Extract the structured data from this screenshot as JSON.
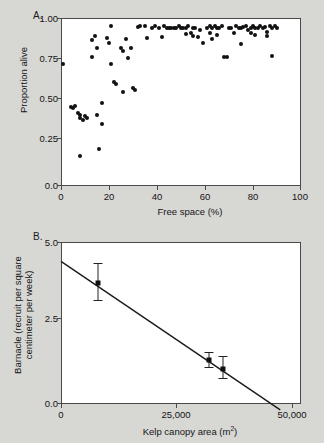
{
  "figure": {
    "background_color": "#d7d7d4",
    "plot_background": "#ffffff",
    "axis_color": "#4a4a4a",
    "marker_color": "#111111"
  },
  "panel_a": {
    "letter": "A.",
    "ylabel": "Proportion alive",
    "xlabel": "Free space (%)",
    "ytick_labels": [
      "1.00",
      "0.75",
      "0.50",
      "0.25",
      "0.0"
    ],
    "xtick_labels": [
      "0",
      "20",
      "40",
      "60",
      "80",
      "100"
    ]
  },
  "panel_b": {
    "letter": "B.",
    "ylabel_line1": "Barnacle (recruit per square",
    "ylabel_line2": "centimeter per week)",
    "xlabel_prefix": "Kelp canopy area (m",
    "xlabel_sup": "2",
    "xlabel_suffix": ")",
    "ytick_labels": [
      "5.0",
      "2.5",
      "0.0"
    ],
    "xtick_labels": [
      "0",
      "25,000",
      "50,000"
    ]
  },
  "chart_data": [
    {
      "type": "scatter",
      "panel": "A",
      "title": "",
      "xlabel": "Free space (%)",
      "ylabel": "Proportion alive",
      "xlim": [
        0,
        100
      ],
      "ylim": [
        0.0,
        1.05
      ],
      "xticks": [
        0,
        20,
        40,
        60,
        80,
        100
      ],
      "yticks": [
        0.0,
        0.25,
        0.5,
        0.75,
        1.0
      ],
      "grid": false,
      "legend": "none",
      "marker": "filled-circle",
      "points": [
        [
          1,
          0.765
        ],
        [
          4,
          0.495
        ],
        [
          5,
          0.49
        ],
        [
          6,
          0.5
        ],
        [
          7,
          0.455
        ],
        [
          8,
          0.445
        ],
        [
          8,
          0.425
        ],
        [
          8,
          0.185
        ],
        [
          9,
          0.41
        ],
        [
          10,
          0.435
        ],
        [
          11,
          0.425
        ],
        [
          13,
          0.91
        ],
        [
          13,
          0.805
        ],
        [
          14,
          0.935
        ],
        [
          15,
          0.86
        ],
        [
          15,
          0.445
        ],
        [
          16,
          0.23
        ],
        [
          17,
          0.52
        ],
        [
          17,
          0.385
        ],
        [
          19,
          0.925
        ],
        [
          20,
          0.895
        ],
        [
          21,
          1.0
        ],
        [
          21,
          0.765
        ],
        [
          22,
          0.65
        ],
        [
          23,
          0.635
        ],
        [
          25,
          0.86
        ],
        [
          26,
          0.845
        ],
        [
          26,
          0.59
        ],
        [
          27,
          0.92
        ],
        [
          28,
          0.8
        ],
        [
          29,
          0.865
        ],
        [
          30,
          0.615
        ],
        [
          31,
          0.6
        ],
        [
          32,
          0.995
        ],
        [
          33,
          1.0
        ],
        [
          35,
          1.0
        ],
        [
          36,
          0.925
        ],
        [
          38,
          0.985
        ],
        [
          39,
          1.0
        ],
        [
          41,
          0.99
        ],
        [
          42,
          0.93
        ],
        [
          43,
          1.0
        ],
        [
          44,
          0.985
        ],
        [
          45,
          0.985
        ],
        [
          46,
          0.99
        ],
        [
          47,
          0.985
        ],
        [
          48,
          0.99
        ],
        [
          49,
          1.0
        ],
        [
          50,
          0.985
        ],
        [
          51,
          0.99
        ],
        [
          52,
          0.95
        ],
        [
          52,
          0.985
        ],
        [
          53,
          1.0
        ],
        [
          54,
          0.955
        ],
        [
          55,
          0.985
        ],
        [
          55,
          0.94
        ],
        [
          56,
          0.99
        ],
        [
          57,
          0.93
        ],
        [
          58,
          0.975
        ],
        [
          59,
          0.895
        ],
        [
          61,
          0.99
        ],
        [
          62,
          1.0
        ],
        [
          62,
          0.955
        ],
        [
          63,
          0.985
        ],
        [
          63,
          0.92
        ],
        [
          64,
          1.0
        ],
        [
          65,
          0.985
        ],
        [
          65,
          0.945
        ],
        [
          66,
          0.99
        ],
        [
          67,
          1.0
        ],
        [
          68,
          0.805
        ],
        [
          69,
          0.805
        ],
        [
          70,
          0.985
        ],
        [
          71,
          0.99
        ],
        [
          72,
          0.955
        ],
        [
          73,
          1.0
        ],
        [
          74,
          0.985
        ],
        [
          75,
          0.99
        ],
        [
          75,
          0.885
        ],
        [
          76,
          0.995
        ],
        [
          77,
          1.0
        ],
        [
          78,
          0.975
        ],
        [
          79,
          0.99
        ],
        [
          79,
          0.955
        ],
        [
          80,
          1.0
        ],
        [
          81,
          0.985
        ],
        [
          81,
          0.945
        ],
        [
          82,
          0.99
        ],
        [
          83,
          1.0
        ],
        [
          84,
          0.985
        ],
        [
          85,
          0.995
        ],
        [
          86,
          0.965
        ],
        [
          86,
          0.935
        ],
        [
          87,
          1.0
        ],
        [
          88,
          0.985
        ],
        [
          88,
          0.815
        ],
        [
          89,
          1.0
        ],
        [
          90,
          0.99
        ]
      ]
    },
    {
      "type": "scatter",
      "panel": "B",
      "title": "",
      "xlabel": "Kelp canopy area (m2)",
      "ylabel": "Barnacle (recruit per square centimeter per week)",
      "xlim": [
        0,
        52000
      ],
      "ylim": [
        0.0,
        5.0
      ],
      "xticks": [
        0,
        25000,
        50000
      ],
      "yticks": [
        0.0,
        2.5,
        5.0
      ],
      "grid": false,
      "legend": "none",
      "marker": "filled-square",
      "errorbars": true,
      "points": [
        {
          "x": 8000,
          "y": 3.75,
          "yerr_low": 3.21,
          "yerr_high": 4.35
        },
        {
          "x": 32000,
          "y": 1.36,
          "yerr_low": 1.13,
          "yerr_high": 1.62
        },
        {
          "x": 35000,
          "y": 1.07,
          "yerr_low": 0.79,
          "yerr_high": 1.48
        }
      ],
      "fit_line": {
        "x_start": 0,
        "y_start": 4.4,
        "x_end": 47500,
        "y_end": -0.18,
        "style": "solid",
        "color": "#1a1a1a"
      }
    }
  ]
}
